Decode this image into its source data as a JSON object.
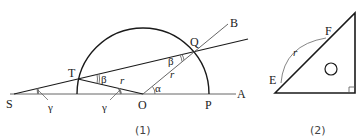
{
  "figure1": {
    "caption": "(1)",
    "points": {
      "S": "S",
      "T": "T",
      "O": "O",
      "P": "P",
      "A": "A",
      "Q": "Q",
      "B": "B"
    },
    "angles": {
      "gamma_S": "γ",
      "gamma_O": "γ",
      "beta_T": "β",
      "beta_Q": "β",
      "alpha": "α"
    },
    "lengths": {
      "r_OT": "r",
      "r_OQ": "r"
    }
  },
  "figure2": {
    "caption": "(2)",
    "points": {
      "E": "E",
      "F": "F"
    },
    "arc_label": "r",
    "inner_mark": "○"
  },
  "colors": {
    "stroke": "#1a1a1a",
    "thin_stroke": "#555555",
    "text": "#222222"
  }
}
